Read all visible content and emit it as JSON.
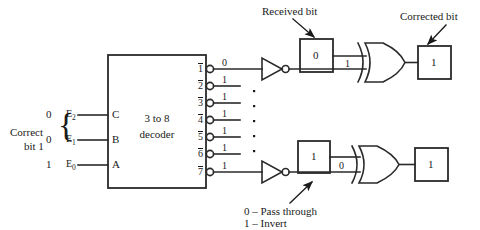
{
  "diagram": {
    "line_color": "#2a2a2a",
    "text_color": "#1a1a1a",
    "background": "#ffffff"
  },
  "decoder": {
    "label_line1": "3 to 8",
    "label_line2": "decoder",
    "input_pins": [
      "C",
      "B",
      "A"
    ],
    "input_signals": [
      "E2",
      "E1",
      "E0"
    ],
    "input_signal_base": [
      "E",
      "E",
      "E"
    ],
    "input_signal_sub": [
      "2",
      "1",
      "0"
    ],
    "input_values": [
      "0",
      "0",
      "1"
    ],
    "output_pins": [
      "1",
      "2",
      "3",
      "4",
      "5",
      "6",
      "7"
    ],
    "output_values": [
      "0",
      "1",
      "1",
      "1",
      "1",
      "1",
      "1"
    ]
  },
  "left_annotation": {
    "line1": "Correct",
    "line2": "bit 1"
  },
  "rows": {
    "top": {
      "received_bit_label": "Received bit",
      "received_bit_value": "0",
      "xor_other_input_value": "1",
      "corrected_bit_label": "Corrected bit",
      "corrected_bit_value": "1"
    },
    "bottom": {
      "received_bit_value": "1",
      "xor_other_input_value": "0",
      "corrected_bit_value": "1"
    }
  },
  "legend": {
    "line1": "0 – Pass through",
    "line2": "1 – Invert"
  },
  "ellipsis": {
    "vertical_dots_count": 5,
    "decoder_dots_count": 3
  }
}
